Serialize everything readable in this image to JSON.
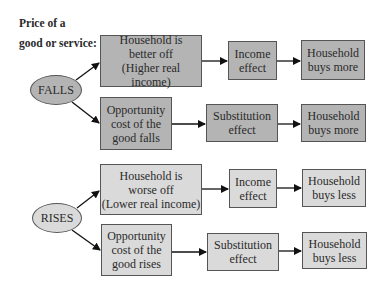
{
  "title": [
    "Price of a",
    "good or service:"
  ],
  "colors": {
    "falls_fill": "#b4b4b4",
    "rises_fill": "#dadada",
    "stroke": "#555555",
    "arrow": "#111111"
  },
  "falls": {
    "label": "FALLS",
    "income_path": {
      "cause": [
        "Household is",
        "better off",
        "(Higher real income)"
      ],
      "effect": [
        "Income",
        "effect"
      ],
      "result": [
        "Household",
        "buys more"
      ]
    },
    "substitution_path": {
      "cause": [
        "Opportunity",
        "cost of the",
        "good falls"
      ],
      "effect": [
        "Substitution",
        "effect"
      ],
      "result": [
        "Household",
        "buys more"
      ]
    }
  },
  "rises": {
    "label": "RISES",
    "income_path": {
      "cause": [
        "Household is",
        "worse off",
        "(Lower real income)"
      ],
      "effect": [
        "Income",
        "effect"
      ],
      "result": [
        "Household",
        "buys less"
      ]
    },
    "substitution_path": {
      "cause": [
        "Opportunity",
        "cost of the",
        "good rises"
      ],
      "effect": [
        "Substitution",
        "effect"
      ],
      "result": [
        "Household",
        "buys less"
      ]
    }
  }
}
